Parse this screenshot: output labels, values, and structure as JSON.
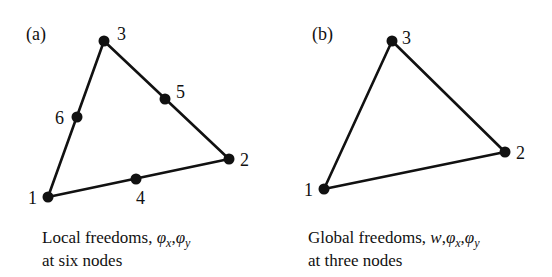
{
  "panels": [
    {
      "id": "a",
      "label": "(a)",
      "label_pos": [
        26,
        40
      ],
      "edges": [
        [
          1,
          2
        ],
        [
          2,
          3
        ],
        [
          3,
          1
        ]
      ],
      "nodes": [
        {
          "id": "1",
          "x": 48,
          "y": 197,
          "lx": 28,
          "ly": 204
        },
        {
          "id": "2",
          "x": 229,
          "y": 159,
          "lx": 240,
          "ly": 166
        },
        {
          "id": "3",
          "x": 104,
          "y": 41,
          "lx": 117,
          "ly": 40
        },
        {
          "id": "4",
          "x": 136,
          "y": 179,
          "lx": 136,
          "ly": 204
        },
        {
          "id": "5",
          "x": 165,
          "y": 99,
          "lx": 176,
          "ly": 98
        },
        {
          "id": "6",
          "x": 77,
          "y": 117,
          "lx": 55,
          "ly": 124
        }
      ],
      "caption": {
        "line1_prefix": "Local freedoms, ",
        "symbols": [
          "φ",
          "x",
          ",",
          "φ",
          "y"
        ],
        "line2": "at six nodes"
      }
    },
    {
      "id": "b",
      "label": "(b)",
      "label_pos": [
        312,
        40
      ],
      "edges": [
        [
          1,
          2
        ],
        [
          2,
          3
        ],
        [
          3,
          1
        ]
      ],
      "nodes": [
        {
          "id": "1",
          "x": 324,
          "y": 189,
          "lx": 304,
          "ly": 196
        },
        {
          "id": "2",
          "x": 505,
          "y": 152,
          "lx": 516,
          "ly": 159
        },
        {
          "id": "3",
          "x": 392,
          "y": 41,
          "lx": 402,
          "ly": 44
        }
      ],
      "caption": {
        "line1_prefix": "Global freedoms, ",
        "w": "w",
        "symbols": [
          "φ",
          "x",
          ",",
          "φ",
          "y"
        ],
        "line2": "at three nodes"
      }
    }
  ]
}
